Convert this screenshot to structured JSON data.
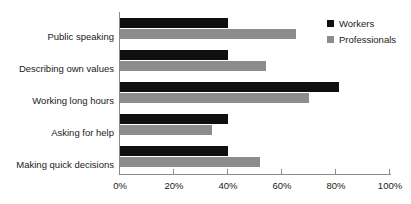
{
  "chart_data": {
    "type": "bar",
    "orientation": "horizontal",
    "title": "",
    "xlabel": "",
    "ylabel": "",
    "categories": [
      "Public speaking",
      "Describing own values",
      "Working long hours",
      "Asking for help",
      "Making quick decisions"
    ],
    "series": [
      {
        "name": "Workers",
        "color": "#100f0f",
        "values": [
          40,
          40,
          81,
          40,
          40
        ]
      },
      {
        "name": "Professionals",
        "color": "#8c8c8c",
        "values": [
          65,
          54,
          70,
          34,
          52
        ]
      }
    ],
    "xlim": [
      0,
      100
    ],
    "xticks": [
      0,
      20,
      40,
      60,
      80,
      100
    ],
    "xtick_labels": [
      "0%",
      "20%",
      "40%",
      "60%",
      "80%",
      "100%"
    ],
    "grid": false,
    "legend_position": "top-right",
    "value_unit": "%"
  },
  "legend": {
    "entries": [
      {
        "label": "Workers",
        "color": "#100f0f"
      },
      {
        "label": "Professionals",
        "color": "#8c8c8c"
      }
    ]
  },
  "axis": {
    "tick_labels": [
      "0%",
      "20%",
      "40%",
      "60%",
      "80%",
      "100%"
    ]
  }
}
